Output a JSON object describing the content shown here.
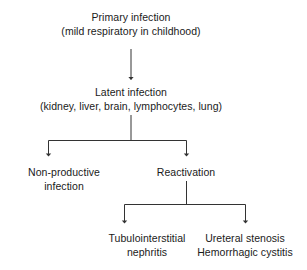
{
  "diagram": {
    "type": "flowchart",
    "orientation": "top-down",
    "background_color": "#ffffff",
    "text_color": "#1a1a1a",
    "line_color": "#333333",
    "nodes": {
      "primary": {
        "line1": "Primary infection",
        "line2": "(mild respiratory in childhood)"
      },
      "latent": {
        "line1": "Latent infection",
        "line2": "(kidney, liver, brain, lymphocytes, lung)"
      },
      "non_productive": {
        "line1": "Non-productive",
        "line2": "infection"
      },
      "reactivation": {
        "line1": "Reactivation"
      },
      "tubulointerstitial": {
        "line1": "Tubulointerstitial",
        "line2": "nephritis"
      },
      "ureteral": {
        "line1": "Ureteral stenosis",
        "line2": "Hemorrhagic cystitis"
      }
    },
    "edges": [
      {
        "id": "primary-to-latent",
        "from": "primary",
        "to": "latent",
        "style": "arrow"
      },
      {
        "id": "latent-to-non-productive",
        "from": "latent",
        "to": "non_productive",
        "style": "elbow-arrow"
      },
      {
        "id": "latent-to-reactivation",
        "from": "latent",
        "to": "reactivation",
        "style": "elbow-arrow"
      },
      {
        "id": "reactivation-to-tubulointerstitial",
        "from": "reactivation",
        "to": "tubulointerstitial",
        "style": "elbow-arrow"
      },
      {
        "id": "reactivation-to-ureteral",
        "from": "reactivation",
        "to": "ureteral",
        "style": "elbow-arrow"
      }
    ]
  }
}
